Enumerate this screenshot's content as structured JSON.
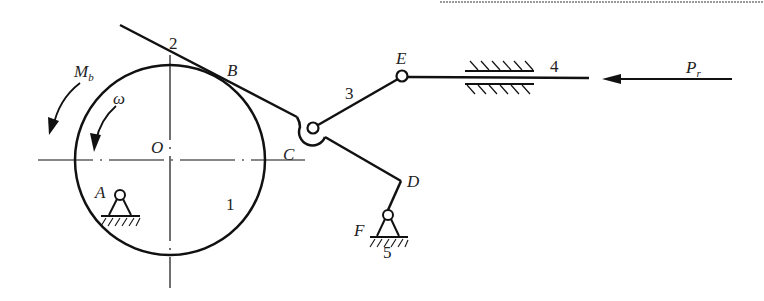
{
  "diagram": {
    "type": "mechanism-linkage",
    "background": "#ffffff",
    "ink_color": "#111111",
    "labels": {
      "moment": "M",
      "moment_sub": "b",
      "omega": "ω",
      "center_O": "O",
      "point_A": "A",
      "point_B": "B",
      "point_C": "C",
      "point_D": "D",
      "point_E": "E",
      "point_F": "F",
      "link_1": "1",
      "link_2": "2",
      "link_3": "3",
      "link_4": "4",
      "link_5": "5",
      "force": "P",
      "force_sub": "r"
    },
    "components": [
      {
        "id": "1",
        "name": "drum/wheel",
        "center": "O"
      },
      {
        "id": "2",
        "name": "band/lever tangent at B"
      },
      {
        "id": "3",
        "name": "connecting link C–E"
      },
      {
        "id": "4",
        "name": "slider in guide"
      },
      {
        "id": "5",
        "name": "ground pivot at F"
      }
    ]
  }
}
